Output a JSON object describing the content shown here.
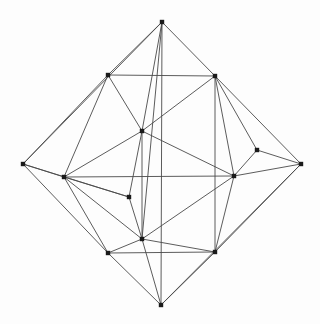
{
  "figure": {
    "kind": "graph-drawing",
    "width": 320,
    "height": 324,
    "background_color": "#fdfdfd",
    "edge_color": "#4a4a4a",
    "edge_width": 0.9,
    "vertex_color": "#1a1a1a",
    "vertex_shape": "square",
    "vertex_size": 4.4,
    "vertex_count": 14,
    "edge_count": 40
  },
  "graph": {
    "vertices": [
      {
        "id": "v0",
        "name": "top-apex",
        "x": 162,
        "y": 22
      },
      {
        "id": "v1",
        "name": "upper-left",
        "x": 108,
        "y": 75
      },
      {
        "id": "v2",
        "name": "upper-right",
        "x": 215,
        "y": 76
      },
      {
        "id": "v3",
        "name": "center-upper",
        "x": 142,
        "y": 131
      },
      {
        "id": "v4",
        "name": "left-apex",
        "x": 23,
        "y": 164
      },
      {
        "id": "v5",
        "name": "right-apex",
        "x": 301,
        "y": 164
      },
      {
        "id": "v6",
        "name": "right-upper-inner",
        "x": 257,
        "y": 150
      },
      {
        "id": "v7",
        "name": "left-inner",
        "x": 64,
        "y": 177
      },
      {
        "id": "v8",
        "name": "right-inner",
        "x": 234,
        "y": 176
      },
      {
        "id": "v9",
        "name": "center-lower",
        "x": 129,
        "y": 197
      },
      {
        "id": "v10",
        "name": "lower-center",
        "x": 142,
        "y": 239
      },
      {
        "id": "v11",
        "name": "lower-left",
        "x": 108,
        "y": 253
      },
      {
        "id": "v12",
        "name": "lower-right",
        "x": 215,
        "y": 252
      },
      {
        "id": "v13",
        "name": "bottom-apex",
        "x": 161,
        "y": 305
      }
    ],
    "edges": [
      {
        "from": "v0",
        "to": "v1"
      },
      {
        "from": "v0",
        "to": "v2"
      },
      {
        "from": "v0",
        "to": "v3"
      },
      {
        "from": "v0",
        "to": "v10"
      },
      {
        "from": "v1",
        "to": "v2"
      },
      {
        "from": "v1",
        "to": "v3"
      },
      {
        "from": "v1",
        "to": "v4"
      },
      {
        "from": "v1",
        "to": "v7"
      },
      {
        "from": "v2",
        "to": "v3"
      },
      {
        "from": "v2",
        "to": "v5"
      },
      {
        "from": "v2",
        "to": "v6"
      },
      {
        "from": "v2",
        "to": "v8"
      },
      {
        "from": "v2",
        "to": "v12"
      },
      {
        "from": "v3",
        "to": "v7"
      },
      {
        "from": "v3",
        "to": "v8"
      },
      {
        "from": "v3",
        "to": "v9"
      },
      {
        "from": "v3",
        "to": "v10"
      },
      {
        "from": "v4",
        "to": "v7"
      },
      {
        "from": "v4",
        "to": "v9"
      },
      {
        "from": "v4",
        "to": "v11"
      },
      {
        "from": "v5",
        "to": "v6"
      },
      {
        "from": "v5",
        "to": "v8"
      },
      {
        "from": "v5",
        "to": "v12"
      },
      {
        "from": "v6",
        "to": "v8"
      },
      {
        "from": "v7",
        "to": "v9"
      },
      {
        "from": "v7",
        "to": "v10"
      },
      {
        "from": "v7",
        "to": "v11"
      },
      {
        "from": "v7",
        "to": "v8"
      },
      {
        "from": "v8",
        "to": "v10"
      },
      {
        "from": "v8",
        "to": "v12"
      },
      {
        "from": "v9",
        "to": "v10"
      },
      {
        "from": "v10",
        "to": "v11"
      },
      {
        "from": "v10",
        "to": "v12"
      },
      {
        "from": "v10",
        "to": "v13"
      },
      {
        "from": "v11",
        "to": "v12"
      },
      {
        "from": "v11",
        "to": "v13"
      },
      {
        "from": "v12",
        "to": "v13"
      },
      {
        "from": "v0",
        "to": "v13"
      },
      {
        "from": "v4",
        "to": "v0"
      },
      {
        "from": "v5",
        "to": "v13"
      }
    ]
  }
}
